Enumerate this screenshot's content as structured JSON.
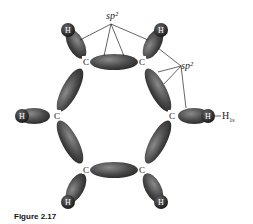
{
  "figure": {
    "caption": "Figure 2.17",
    "labels": {
      "sp2_top": "sp²",
      "sp2_right": "sp²",
      "h1s": "H",
      "h1s_sub": "1s"
    },
    "atoms": {
      "carbon": "C",
      "hydrogen": "H"
    },
    "colors": {
      "lobe_dark": "#3a3a3a",
      "lobe_mid": "#6a6a6a",
      "lobe_light": "#9a9a9a",
      "hydrogen": "#2a2a2a",
      "line": "#222222"
    }
  }
}
